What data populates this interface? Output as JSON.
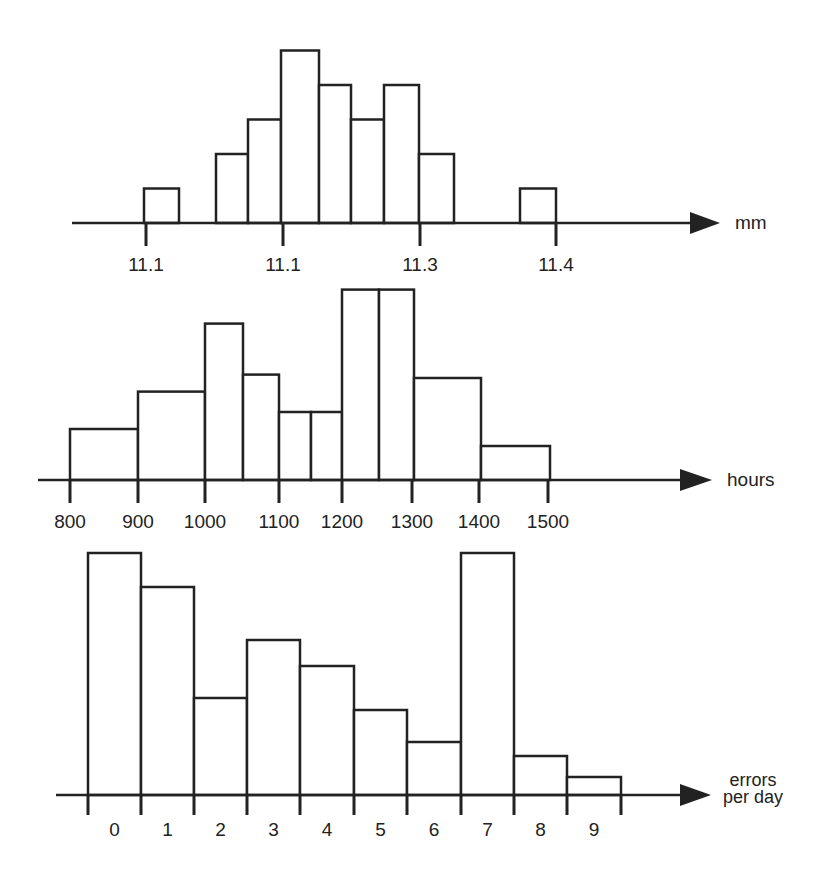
{
  "figure": {
    "background": "#ffffff",
    "stroke_color": "#222222",
    "bar_fill": "#ffffff"
  },
  "chart_data": [
    {
      "type": "bar",
      "title": "",
      "xlabel": "mm",
      "ylabel": "",
      "grid": false,
      "legend": null,
      "histogram": true,
      "tick_labels": [
        "11.1",
        "11.1",
        "11.3",
        "11.4"
      ],
      "bins": [
        {
          "start": 11.095,
          "end": 11.12,
          "count": 1
        },
        {
          "start": 11.145,
          "end": 11.17,
          "count": 2
        },
        {
          "start": 11.17,
          "end": 11.195,
          "count": 3
        },
        {
          "start": 11.195,
          "end": 11.225,
          "count": 5
        },
        {
          "start": 11.225,
          "end": 11.25,
          "count": 4
        },
        {
          "start": 11.25,
          "end": 11.275,
          "count": 3
        },
        {
          "start": 11.275,
          "end": 11.3,
          "count": 4
        },
        {
          "start": 11.3,
          "end": 11.325,
          "count": 2
        },
        {
          "start": 11.375,
          "end": 11.4,
          "count": 1
        }
      ],
      "values": [
        1,
        2,
        3,
        5,
        4,
        3,
        4,
        2,
        1
      ],
      "layout": {
        "axis_y": 223,
        "axis_x0": 72,
        "axis_x1": 700,
        "arrow_tip": 720,
        "label_x": 735,
        "label_y": 229,
        "ticks_px": [
          146,
          283,
          420,
          556
        ],
        "tick_bottom": 246,
        "tick_label_y": 271,
        "unit_px": 34.5,
        "bars_px": [
          [
            144,
            179
          ],
          [
            216,
            248
          ],
          [
            248,
            281
          ],
          [
            281,
            319
          ],
          [
            319,
            351
          ],
          [
            351,
            384
          ],
          [
            384,
            419
          ],
          [
            419,
            454
          ],
          [
            520,
            556
          ]
        ]
      }
    },
    {
      "type": "bar",
      "title": "",
      "xlabel": "hours",
      "ylabel": "",
      "grid": false,
      "legend": null,
      "histogram": true,
      "tick_labels": [
        "800",
        "900",
        "1000",
        "1100",
        "1200",
        "1300",
        "1400",
        "1500"
      ],
      "bins": [
        {
          "start": 800,
          "end": 900,
          "height": 1.5
        },
        {
          "start": 900,
          "end": 1000,
          "height": 2.6
        },
        {
          "start": 1000,
          "end": 1050,
          "height": 4.6
        },
        {
          "start": 1050,
          "end": 1100,
          "height": 3.1
        },
        {
          "start": 1100,
          "end": 1150,
          "height": 2.0
        },
        {
          "start": 1150,
          "end": 1200,
          "height": 2.0
        },
        {
          "start": 1200,
          "end": 1250,
          "height": 5.6
        },
        {
          "start": 1250,
          "end": 1300,
          "height": 5.6
        },
        {
          "start": 1300,
          "end": 1400,
          "height": 3.0
        },
        {
          "start": 1400,
          "end": 1500,
          "height": 1.0
        }
      ],
      "values": [
        1.5,
        2.6,
        4.6,
        3.1,
        2.0,
        2.0,
        5.6,
        5.6,
        3.0,
        1.0
      ],
      "layout": {
        "axis_y": 480,
        "axis_x0": 38,
        "axis_x1": 690,
        "arrow_tip": 712,
        "label_x": 727,
        "label_y": 486,
        "ticks_px": [
          70,
          138,
          205,
          279,
          342,
          412,
          479,
          548
        ],
        "tick_bottom": 503,
        "tick_label_y": 528,
        "unit_px": 34,
        "bars_px": [
          [
            70,
            138
          ],
          [
            138,
            205
          ],
          [
            205,
            243
          ],
          [
            243,
            279
          ],
          [
            279,
            311
          ],
          [
            311,
            342
          ],
          [
            342,
            379
          ],
          [
            379,
            414
          ],
          [
            414,
            481
          ],
          [
            481,
            550
          ]
        ]
      }
    },
    {
      "type": "bar",
      "title": "",
      "xlabel": "errors per day",
      "xlabel_lines": [
        "errors",
        "per day"
      ],
      "ylabel": "",
      "grid": false,
      "legend": null,
      "histogram": true,
      "categories": [
        "0",
        "1",
        "2",
        "3",
        "4",
        "5",
        "6",
        "7",
        "8",
        "9"
      ],
      "tick_labels": [
        "0",
        "1",
        "2",
        "3",
        "4",
        "5",
        "6",
        "7",
        "8",
        "9"
      ],
      "values": [
        14,
        12,
        5.6,
        9,
        7.5,
        5,
        3,
        14,
        2.2,
        1
      ],
      "layout": {
        "axis_y": 795,
        "axis_x0": 56,
        "axis_x1": 690,
        "arrow_tip": 711,
        "label_x": 753,
        "label_y": [
          786,
          803
        ],
        "ticks_px": [
          88,
          141,
          194,
          247,
          300,
          354,
          407,
          461,
          514,
          567,
          621
        ],
        "tick_bottom": 815,
        "tick_label_y": 836,
        "unit_px": 17.3,
        "bar_tops_px": [
          553,
          587,
          698,
          640,
          666,
          710,
          742,
          553,
          756,
          777
        ]
      }
    }
  ]
}
